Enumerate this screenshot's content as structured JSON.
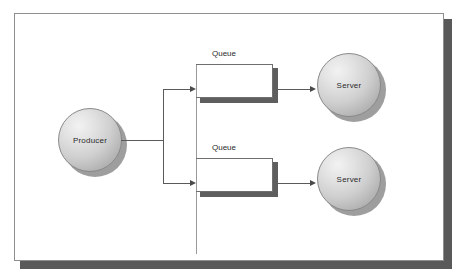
{
  "diagram": {
    "background_color": "#ffffff",
    "frame_border_color": "#8e8e8e",
    "frame_shadow_color": "#595959",
    "node_outline_color": "#8a8a8a",
    "connector_color": "#5a5a5a",
    "queue_line_color": "#6f6f6f",
    "queue_shadow_color": "#5e5e5e",
    "label_color": "#2b2b2b"
  },
  "nodes": {
    "producer": {
      "label": "Producer"
    },
    "servers": [
      {
        "label": "Server"
      },
      {
        "label": "Server"
      }
    ]
  },
  "queues": [
    {
      "label": "Queue",
      "slots": 4,
      "dividers": 3
    },
    {
      "label": "Queue",
      "slots": 4,
      "dividers": 3
    }
  ]
}
